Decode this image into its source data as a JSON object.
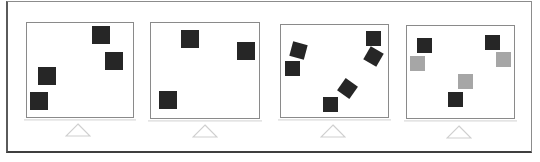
{
  "figure": {
    "colors": {
      "frame": "#5a5a5a",
      "panel_border": "#8a8a8a",
      "dark_square": "#262626",
      "light_square": "#a6a6a6",
      "shelf": "#e4e4e4",
      "triangle": "#cfcfcf"
    },
    "panels": [
      {
        "id": "panel-1",
        "box": {
          "x": 26,
          "y": 22,
          "w": 108,
          "h": 96
        },
        "shelf": {
          "x": 24,
          "y": 119,
          "w": 112
        },
        "triangle": {
          "cx": 78,
          "y": 123
        },
        "squares": [
          {
            "x": 92,
            "y": 26,
            "size": 18,
            "rotate": 0,
            "shade": "dark"
          },
          {
            "x": 105,
            "y": 52,
            "size": 18,
            "rotate": 0,
            "shade": "dark"
          },
          {
            "x": 38,
            "y": 67,
            "size": 18,
            "rotate": 0,
            "shade": "dark"
          },
          {
            "x": 30,
            "y": 92,
            "size": 18,
            "rotate": 0,
            "shade": "dark"
          }
        ]
      },
      {
        "id": "panel-2",
        "box": {
          "x": 150,
          "y": 22,
          "w": 110,
          "h": 97
        },
        "shelf": {
          "x": 148,
          "y": 120,
          "w": 114
        },
        "triangle": {
          "cx": 205,
          "y": 124
        },
        "squares": [
          {
            "x": 181,
            "y": 30,
            "size": 18,
            "rotate": 0,
            "shade": "dark"
          },
          {
            "x": 237,
            "y": 42,
            "size": 18,
            "rotate": 0,
            "shade": "dark"
          },
          {
            "x": 159,
            "y": 91,
            "size": 18,
            "rotate": 0,
            "shade": "dark"
          }
        ]
      },
      {
        "id": "panel-3",
        "box": {
          "x": 280,
          "y": 24,
          "w": 109,
          "h": 94
        },
        "shelf": {
          "x": 278,
          "y": 119,
          "w": 113
        },
        "triangle": {
          "cx": 333,
          "y": 124
        },
        "squares": [
          {
            "x": 366,
            "y": 31,
            "size": 15,
            "rotate": 0,
            "shade": "dark"
          },
          {
            "x": 366,
            "y": 49,
            "size": 15,
            "rotate": 30,
            "shade": "dark"
          },
          {
            "x": 291,
            "y": 43,
            "size": 15,
            "rotate": 15,
            "shade": "dark"
          },
          {
            "x": 285,
            "y": 61,
            "size": 15,
            "rotate": 0,
            "shade": "dark"
          },
          {
            "x": 340,
            "y": 81,
            "size": 15,
            "rotate": 35,
            "shade": "dark"
          },
          {
            "x": 323,
            "y": 97,
            "size": 15,
            "rotate": 0,
            "shade": "dark"
          }
        ]
      },
      {
        "id": "panel-4",
        "box": {
          "x": 406,
          "y": 25,
          "w": 109,
          "h": 94
        },
        "shelf": {
          "x": 404,
          "y": 120,
          "w": 113
        },
        "triangle": {
          "cx": 459,
          "y": 125
        },
        "squares": [
          {
            "x": 417,
            "y": 38,
            "size": 15,
            "rotate": 0,
            "shade": "dark"
          },
          {
            "x": 410,
            "y": 56,
            "size": 15,
            "rotate": 0,
            "shade": "light"
          },
          {
            "x": 485,
            "y": 35,
            "size": 15,
            "rotate": 0,
            "shade": "dark"
          },
          {
            "x": 496,
            "y": 52,
            "size": 15,
            "rotate": 0,
            "shade": "light"
          },
          {
            "x": 458,
            "y": 74,
            "size": 15,
            "rotate": 0,
            "shade": "light"
          },
          {
            "x": 448,
            "y": 92,
            "size": 15,
            "rotate": 0,
            "shade": "dark"
          }
        ]
      }
    ]
  }
}
